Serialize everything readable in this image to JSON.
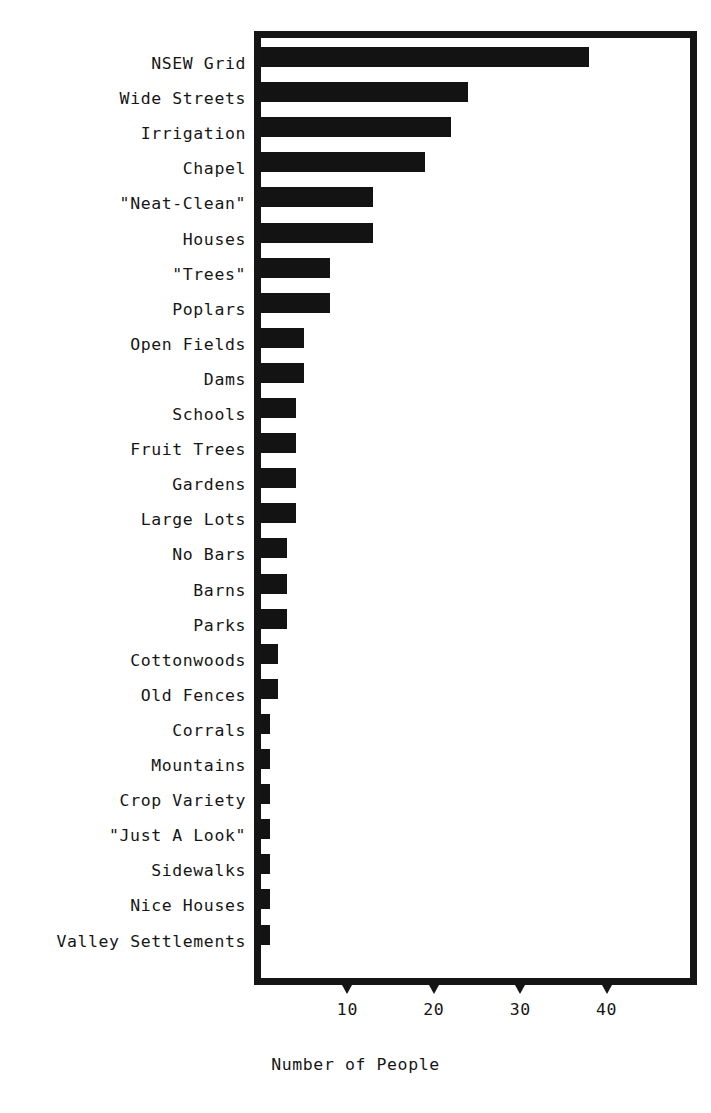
{
  "chart_data": {
    "type": "bar",
    "orientation": "horizontal",
    "title": "",
    "xlabel": "Number of People",
    "ylabel": "",
    "xlim": [
      0,
      50
    ],
    "grid": false,
    "legend": null,
    "xticks": [
      10,
      20,
      30,
      40
    ],
    "xtick_labels": [
      "10",
      "20",
      "30",
      "40"
    ],
    "categories": [
      "NSEW Grid",
      "Wide Streets",
      "Irrigation",
      "Chapel",
      "\"Neat-Clean\"",
      "Houses",
      "\"Trees\"",
      "Poplars",
      "Open Fields",
      "Dams",
      "Schools",
      "Fruit Trees",
      "Gardens",
      "Large Lots",
      "No Bars",
      "Barns",
      "Parks",
      "Cottonwoods",
      "Old Fences",
      "Corrals",
      "Mountains",
      "Crop Variety",
      "\"Just A Look\"",
      "Sidewalks",
      "Nice Houses",
      "Valley Settlements"
    ],
    "values": [
      38,
      24,
      22,
      19,
      13,
      13,
      8,
      8,
      5,
      5,
      4,
      4,
      4,
      4,
      3,
      3,
      3,
      2,
      2,
      1,
      1,
      1,
      1,
      1,
      1,
      1
    ],
    "bar_color": "#131313"
  },
  "axis": {
    "x_title": "Number of People"
  }
}
